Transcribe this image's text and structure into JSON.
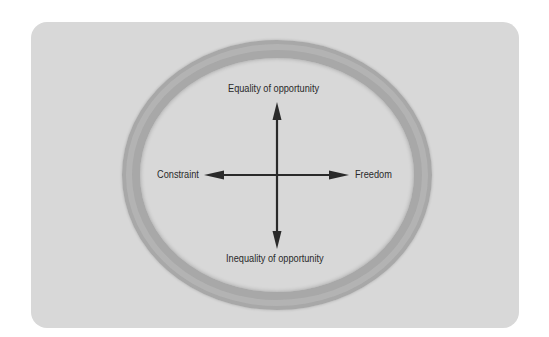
{
  "diagram": {
    "axes": {
      "top_label": "Equality of opportunity",
      "bottom_label": "Inequality of opportunity",
      "left_label": "Constraint",
      "right_label": "Freedom"
    },
    "colors": {
      "background": "#ffffff",
      "card": "#d8d8d8",
      "ring": "#a8a8a8",
      "arrows": "#2a2a2a",
      "text": "#2a2a2a"
    }
  }
}
